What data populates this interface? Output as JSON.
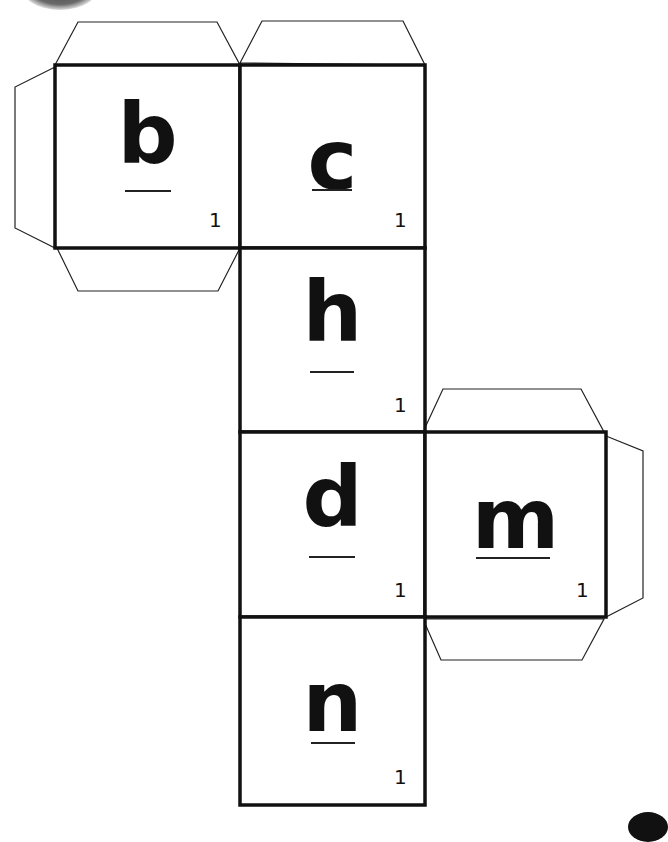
{
  "worksheet": {
    "title": "Letter cube net",
    "header_text": "",
    "faces": [
      {
        "id": "b",
        "letter": "b",
        "count": "1",
        "col": 0,
        "row": 0
      },
      {
        "id": "c",
        "letter": "c",
        "count": "1",
        "col": 1,
        "row": 0
      },
      {
        "id": "h",
        "letter": "h",
        "count": "1",
        "col": 1,
        "row": 1
      },
      {
        "id": "d",
        "letter": "d",
        "count": "1",
        "col": 1,
        "row": 2
      },
      {
        "id": "m",
        "letter": "m",
        "count": "1",
        "col": 2,
        "row": 2
      },
      {
        "id": "n",
        "letter": "n",
        "count": "1",
        "col": 1,
        "row": 3
      }
    ],
    "glue_tabs": [
      "top-of-b",
      "left-of-b",
      "bottom-of-b",
      "top-of-c",
      "top-of-m",
      "right-of-m",
      "bottom-of-m"
    ],
    "colors": {
      "line": "#111111",
      "background": "#ffffff"
    }
  }
}
